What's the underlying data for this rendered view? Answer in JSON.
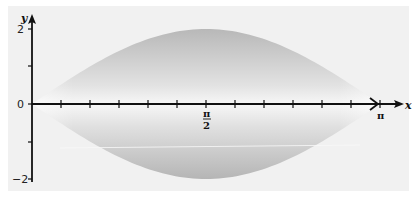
{
  "chart_data": {
    "type": "area",
    "title": "",
    "xlabel": "x",
    "ylabel": "y",
    "xlim": [
      0,
      3.14159
    ],
    "ylim": [
      -2,
      2
    ],
    "grid": false,
    "legend": null,
    "x_ticks": {
      "count_divisions": 12,
      "labels": [
        {
          "value": 1.5708,
          "label_num": "π",
          "label_den": "2"
        },
        {
          "value": 3.14159,
          "label": "π"
        }
      ]
    },
    "y_ticks": [
      {
        "value": 2,
        "label": "2"
      },
      {
        "value": 1,
        "label": ""
      },
      {
        "value": 0,
        "label": "0"
      },
      {
        "value": -1,
        "label": ""
      },
      {
        "value": -2,
        "label": "-2"
      }
    ],
    "series": [
      {
        "name": "y = 2 sin x",
        "x": [
          0,
          0.2618,
          0.5236,
          0.7854,
          1.0472,
          1.309,
          1.5708,
          1.8326,
          2.0944,
          2.3562,
          2.618,
          2.8798,
          3.14159
        ],
        "values": [
          0,
          0.52,
          1.0,
          1.41,
          1.73,
          1.93,
          2.0,
          1.93,
          1.73,
          1.41,
          1.0,
          0.52,
          0
        ]
      },
      {
        "name": "y = -2 sin x",
        "x": [
          0,
          0.2618,
          0.5236,
          0.7854,
          1.0472,
          1.309,
          1.5708,
          1.8326,
          2.0944,
          2.3562,
          2.618,
          2.8798,
          3.14159
        ],
        "values": [
          0,
          -0.52,
          -1.0,
          -1.41,
          -1.73,
          -1.93,
          -2.0,
          -1.93,
          -1.73,
          -1.41,
          -1.0,
          -0.52,
          0
        ]
      }
    ],
    "annotations": [
      "shaded lens-shaped region between y = 2 sin x and y = -2 sin x (surface of revolution)"
    ]
  },
  "labels": {
    "x_axis": "x",
    "y_axis": "y",
    "y_top": "2",
    "y_zero": "0",
    "y_bottom": "−2",
    "pi_half_num": "π",
    "pi_half_den": "2",
    "pi": "π"
  },
  "colors": {
    "panel": "#f1f1f1",
    "fill_dark": "#b9b9b9",
    "fill_light": "#f4f4f4",
    "axis": "#111111"
  }
}
